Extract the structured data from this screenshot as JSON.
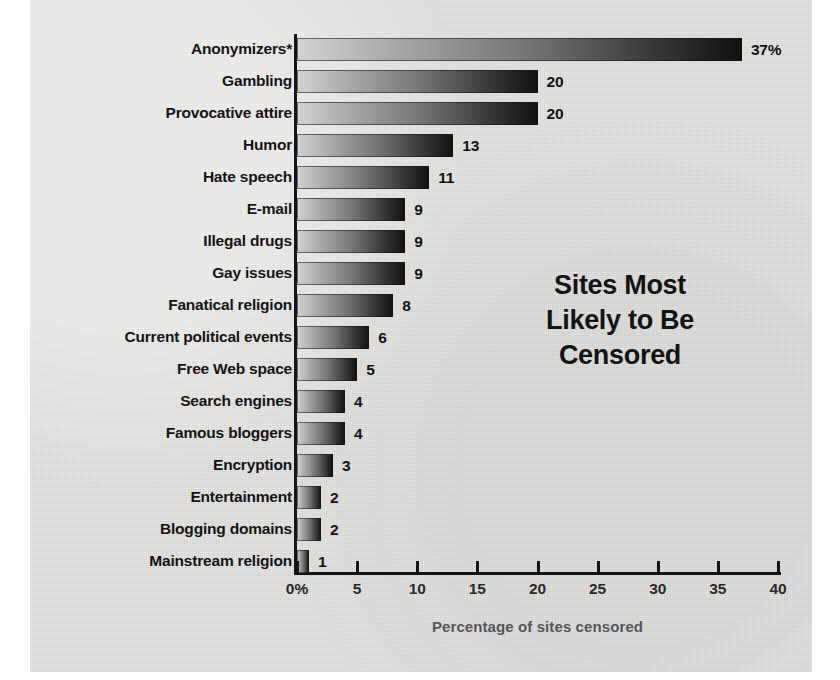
{
  "chart_data": {
    "type": "bar",
    "orientation": "horizontal",
    "title": "Sites Most Likely to Be Censored",
    "title_lines": [
      "Sites Most",
      "Likely to Be",
      "Censored"
    ],
    "xlabel": "Percentage of sites censored",
    "ylabel": "",
    "xlim": [
      0,
      40
    ],
    "grid": false,
    "legend": null,
    "tick_labels": [
      "0%",
      "5",
      "10",
      "15",
      "20",
      "25",
      "30",
      "35",
      "40"
    ],
    "ticks": [
      0,
      5,
      10,
      15,
      20,
      25,
      30,
      35,
      40
    ],
    "categories": [
      "Anonymizers*",
      "Gambling",
      "Provocative attire",
      "Humor",
      "Hate speech",
      "E-mail",
      "Illegal drugs",
      "Gay issues",
      "Fanatical religion",
      "Current political events",
      "Free Web space",
      "Search engines",
      "Famous bloggers",
      "Encryption",
      "Entertainment",
      "Blogging domains",
      "Mainstream religion"
    ],
    "values": [
      37,
      20,
      20,
      13,
      11,
      9,
      9,
      9,
      8,
      6,
      5,
      4,
      4,
      3,
      2,
      2,
      1
    ],
    "value_labels": [
      "37%",
      "20",
      "20",
      "13",
      "11",
      "9",
      "9",
      "9",
      "8",
      "6",
      "5",
      "4",
      "4",
      "3",
      "2",
      "2",
      "1"
    ],
    "bar_colors": {
      "gradient_start": "#d2d2d0",
      "gradient_end": "#111110"
    },
    "background_color": "#e3e3e1",
    "axis_color": "#141414",
    "axis_label_color": "#56565a"
  }
}
